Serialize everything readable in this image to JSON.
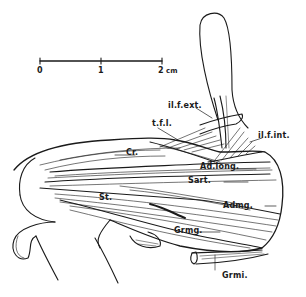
{
  "figure": {
    "type": "anatomical-illustration",
    "ink_color": "#1a1a1a",
    "background": "#ffffff"
  },
  "scale_bar": {
    "ticks": [
      "0",
      "1",
      "2"
    ],
    "unit": "cm",
    "last_label": "2 cm"
  },
  "labels": {
    "il_f_ext": "il.f.ext.",
    "t_f_l": "t.f.l.",
    "il_f_int": "il.f.int.",
    "cr": "Cr.",
    "ad_long": "Ad.long.",
    "sart": "Sart.",
    "st": "St.",
    "admg": "Admg.",
    "grmg": "Grmg.",
    "grmi": "Grmi."
  }
}
